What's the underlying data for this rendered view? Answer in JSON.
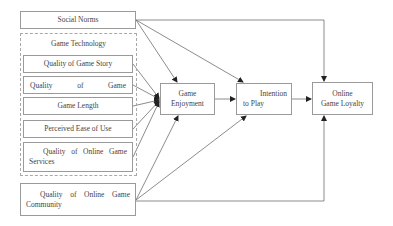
{
  "diagram": {
    "nodes": {
      "social_norms": "Social Norms",
      "game_technology_group": "Game Technology",
      "quality_game_story": "Quality of Game Story",
      "quality_game": "Quality of Game",
      "game_length": "Game Length",
      "perceived_ease": "Perceived Ease of Use",
      "quality_online_services": "Quality of Online Game Services",
      "quality_online_community": "Quality of Online Game Community",
      "game_enjoyment_line1": "Game",
      "game_enjoyment_line2": "Enjoyment",
      "intention_line1": "Intention",
      "intention_line2": "to Play",
      "loyalty_line1": "Online",
      "loyalty_line2": "Game Loyalty"
    },
    "edges": [
      {
        "from": "Social Norms",
        "to": "Game Enjoyment"
      },
      {
        "from": "Social Norms",
        "to": "Intention to Play"
      },
      {
        "from": "Social Norms",
        "to": "Online Game Loyalty"
      },
      {
        "from": "Quality of Game Story",
        "to": "Game Enjoyment"
      },
      {
        "from": "Quality of Game",
        "to": "Game Enjoyment"
      },
      {
        "from": "Game Length",
        "to": "Game Enjoyment"
      },
      {
        "from": "Perceived Ease of Use",
        "to": "Game Enjoyment"
      },
      {
        "from": "Quality of Online Game Services",
        "to": "Game Enjoyment"
      },
      {
        "from": "Game Enjoyment",
        "to": "Intention to Play"
      },
      {
        "from": "Intention to Play",
        "to": "Online Game Loyalty"
      },
      {
        "from": "Quality of Online Game Community",
        "to": "Game Enjoyment"
      },
      {
        "from": "Quality of Online Game Community",
        "to": "Intention to Play"
      },
      {
        "from": "Quality of Online Game Community",
        "to": "Online Game Loyalty"
      }
    ]
  }
}
